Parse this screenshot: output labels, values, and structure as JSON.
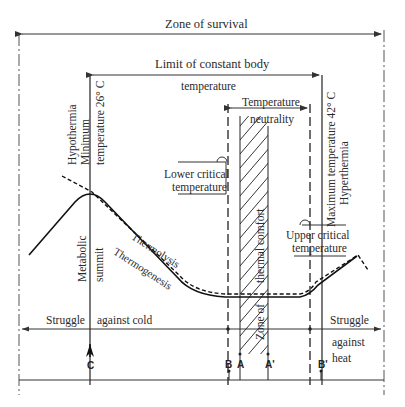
{
  "diagram": {
    "title_zone": "Zone of survival",
    "limit_line1": "Limit of constant body",
    "limit_line2": "temperature",
    "neutrality_line1": "Temperature",
    "neutrality_line2": "neutrality",
    "hypothermia": "Hypothermia",
    "minimum": "Minimum",
    "min_temp": "temperature 26° C",
    "max_temp": "Maximum temperature 42° C",
    "hyperthermia": "Hyperthermia",
    "lower_critical_1": "Lower critical",
    "lower_critical_2": "temperature",
    "upper_critical_1": "Upper critical",
    "upper_critical_2": "temperature",
    "metabolic": "Metabolic",
    "summit": "summit",
    "thermolysis": "Thermolysis",
    "thermogenesis": "Thermogenesis",
    "thermal_comfort": "thermal comfort",
    "zone_of": "Zone of",
    "struggle_cold_1": "Struggle",
    "struggle_cold_2": "against cold",
    "struggle_heat_1": "Struggle",
    "struggle_heat_2": "against",
    "struggle_heat_3": "heat",
    "markers": {
      "c": "C",
      "b": "B",
      "a": "A",
      "a_prime": "A'",
      "b_prime": "B'"
    }
  }
}
